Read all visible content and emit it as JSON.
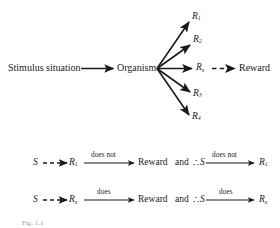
{
  "figure": {
    "type": "flow-diagram",
    "title_caption": "Fig. 1.1",
    "top_diagram": {
      "stimulus_label": "Stimulus situation",
      "organism_label": "Organism",
      "reward_label": "Reward",
      "responses": [
        {
          "base": "R",
          "subscript": "1",
          "id": "r1"
        },
        {
          "base": "R",
          "subscript": "2",
          "id": "r2"
        },
        {
          "base": "R",
          "subscript": "x",
          "id": "rx"
        },
        {
          "base": "R",
          "subscript": "3",
          "id": "r3"
        },
        {
          "base": "R",
          "subscript": "4",
          "id": "r4"
        }
      ],
      "rewarded_response": "Rx",
      "solid_arrow_note": "solid arrows",
      "dashed_arrow_note": "dashed arrow"
    },
    "equations": [
      {
        "id": "eq-not-rewarded",
        "left_symbol": "S",
        "left_connector_style": "dashed",
        "response": {
          "base": "R",
          "subscript": "1"
        },
        "arrow1_label": "does not",
        "outcome": "Reward",
        "conjunction": "and",
        "therefore_symbol": "∴",
        "right_symbol": "S",
        "arrow2_label": "does not",
        "result": {
          "base": "R",
          "subscript": "1"
        }
      },
      {
        "id": "eq-rewarded",
        "left_symbol": "S",
        "left_connector_style": "dashed",
        "response": {
          "base": "R",
          "subscript": "x"
        },
        "arrow1_label": "does",
        "outcome": "Reward",
        "conjunction": "and",
        "therefore_symbol": "∴",
        "right_symbol": "S",
        "arrow2_label": "does",
        "result": {
          "base": "R",
          "subscript": "x"
        }
      }
    ],
    "colors": {
      "background": "#ffffff",
      "ink": "#1a1a1a",
      "caption_ink": "#9a9a9a"
    }
  }
}
